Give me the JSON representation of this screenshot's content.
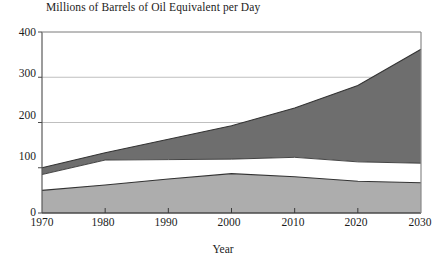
{
  "chart_data": {
    "type": "area",
    "title": "Millions of Barrels of Oil Equivalent per Day",
    "xlabel": "Year",
    "ylabel": "",
    "x": [
      1970,
      1980,
      1990,
      2000,
      2010,
      2020,
      2030
    ],
    "xtick_labels": [
      "1970",
      "1980",
      "1990",
      "2000",
      "2010",
      "2020",
      "2030"
    ],
    "ytick_labels": [
      "0",
      "100",
      "200",
      "300",
      "400"
    ],
    "yticks": [
      0,
      100,
      200,
      300,
      400
    ],
    "xlim": [
      1970,
      2030
    ],
    "ylim": [
      0,
      400
    ],
    "grid": true,
    "stacked": true,
    "legend": "none",
    "series": [
      {
        "name": "lower-band",
        "color": "#adadad",
        "values": [
          50,
          62,
          75,
          87,
          80,
          70,
          67
        ],
        "cumulative_top": [
          50,
          62,
          75,
          87,
          80,
          70,
          67
        ]
      },
      {
        "name": "middle-band",
        "color": "#ffffff",
        "values": [
          35,
          55,
          43,
          32,
          43,
          43,
          43
        ],
        "cumulative_top": [
          85,
          117,
          118,
          119,
          123,
          113,
          110
        ]
      },
      {
        "name": "upper-band",
        "color": "#6e6e6e",
        "values": [
          15,
          16,
          45,
          74,
          109,
          169,
          252
        ],
        "cumulative_top": [
          100,
          133,
          163,
          193,
          232,
          282,
          362
        ]
      }
    ],
    "total": [
      100,
      133,
      163,
      193,
      232,
      282,
      362
    ],
    "colors": {
      "upper_band": "#6e6e6e",
      "middle_band": "#ffffff",
      "lower_band": "#adadad",
      "axis": "#555555",
      "grid": "#b8b8b8",
      "text": "#1c1c1c",
      "background": "#ffffff"
    }
  },
  "ytick_positions": [
    {
      "label": "400",
      "top": 26
    },
    {
      "label": "300",
      "top": 67
    },
    {
      "label": "200",
      "top": 109
    },
    {
      "label": "100",
      "top": 150
    },
    {
      "label": "0",
      "top": 206
    }
  ],
  "xtick_positions": [
    {
      "label": "1970",
      "left": 18
    },
    {
      "label": "1980",
      "left": 79
    },
    {
      "label": "1990",
      "left": 142
    },
    {
      "label": "2000",
      "left": 205
    },
    {
      "label": "2010",
      "left": 269
    },
    {
      "label": "2020",
      "left": 332
    },
    {
      "label": "2030",
      "left": 396
    }
  ]
}
